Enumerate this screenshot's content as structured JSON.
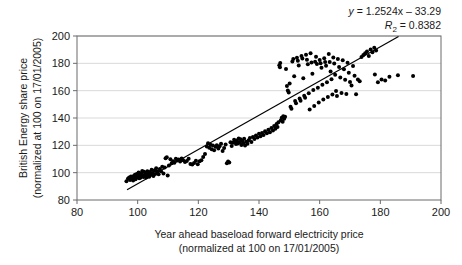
{
  "chart_data": {
    "type": "scatter",
    "title": "",
    "xlabel": "Year ahead baseload forward electricity price",
    "xlabel_line2": "(normalized at 100 on 17/01/2005)",
    "ylabel": "British Energy share price",
    "ylabel_line2": "(normalized at 100 on 17/01/2005)",
    "xlim": [
      80,
      200
    ],
    "ylim": [
      80,
      200
    ],
    "xticks": [
      80,
      100,
      120,
      140,
      160,
      180,
      200
    ],
    "yticks": [
      80,
      100,
      120,
      140,
      160,
      180,
      200
    ],
    "grid": "horizontal",
    "legend": "none",
    "annotations": {
      "equation": "y = 1.2524x – 33.29",
      "r_squared": "R² = 0.8382",
      "equation_y_symbol": "y",
      "equation_body": " = 1.2524x – 33.29",
      "r2_symbol": "R",
      "r2_sub": "2",
      "r2_body": " = 0.8382"
    },
    "trendline": {
      "slope": 1.2524,
      "intercept": -33.29,
      "x_start": 96.5,
      "x_end": 186.0,
      "color": "#000000"
    },
    "marker": {
      "shape": "circle",
      "color": "#000000",
      "size": 2.0
    },
    "point_count": 221,
    "points": [
      [
        96.3,
        93.8
      ],
      [
        96.8,
        95.5
      ],
      [
        97.2,
        96.4
      ],
      [
        97.5,
        94.7
      ],
      [
        97.8,
        97.2
      ],
      [
        98.0,
        95.8
      ],
      [
        98.3,
        96.9
      ],
      [
        98.5,
        94.3
      ],
      [
        98.7,
        97.6
      ],
      [
        98.9,
        96.1
      ],
      [
        99.1,
        98.4
      ],
      [
        99.3,
        95.2
      ],
      [
        99.5,
        97.0
      ],
      [
        99.7,
        99.1
      ],
      [
        99.9,
        96.6
      ],
      [
        100.1,
        97.8
      ],
      [
        100.3,
        100.2
      ],
      [
        100.5,
        95.9
      ],
      [
        100.7,
        98.7
      ],
      [
        100.9,
        96.3
      ],
      [
        101.1,
        99.5
      ],
      [
        101.3,
        97.4
      ],
      [
        101.5,
        101.3
      ],
      [
        101.7,
        98.1
      ],
      [
        101.9,
        96.8
      ],
      [
        102.1,
        100.6
      ],
      [
        102.3,
        97.9
      ],
      [
        102.5,
        99.8
      ],
      [
        102.8,
        96.5
      ],
      [
        103.0,
        98.3
      ],
      [
        103.2,
        101.0
      ],
      [
        103.5,
        99.2
      ],
      [
        103.8,
        97.1
      ],
      [
        104.0,
        100.4
      ],
      [
        104.3,
        98.6
      ],
      [
        104.6,
        102.1
      ],
      [
        104.9,
        99.7
      ],
      [
        105.2,
        97.5
      ],
      [
        105.5,
        101.5
      ],
      [
        105.8,
        99.0
      ],
      [
        106.1,
        103.2
      ],
      [
        106.5,
        100.8
      ],
      [
        106.9,
        98.9
      ],
      [
        107.3,
        102.6
      ],
      [
        107.7,
        101.1
      ],
      [
        108.1,
        104.3
      ],
      [
        108.5,
        99.4
      ],
      [
        108.9,
        103.8
      ],
      [
        109.2,
        110.6
      ],
      [
        109.6,
        111.2
      ],
      [
        109.9,
        97.9
      ],
      [
        110.3,
        105.2
      ],
      [
        110.8,
        109.8
      ],
      [
        111.2,
        106.9
      ],
      [
        111.7,
        108.4
      ],
      [
        112.1,
        107.3
      ],
      [
        112.6,
        110.1
      ],
      [
        113.0,
        108.9
      ],
      [
        113.5,
        109.6
      ],
      [
        114.0,
        108.2
      ],
      [
        114.5,
        110.4
      ],
      [
        115.0,
        109.1
      ],
      [
        115.6,
        107.8
      ],
      [
        116.2,
        108.6
      ],
      [
        116.8,
        110.2
      ],
      [
        117.4,
        106.4
      ],
      [
        118.0,
        105.9
      ],
      [
        118.6,
        107.1
      ],
      [
        119.2,
        108.8
      ],
      [
        119.8,
        106.2
      ],
      [
        120.4,
        108.3
      ],
      [
        121.0,
        109.0
      ],
      [
        121.6,
        111.4
      ],
      [
        122.2,
        113.7
      ],
      [
        122.8,
        119.2
      ],
      [
        123.2,
        121.6
      ],
      [
        123.6,
        118.3
      ],
      [
        124.0,
        120.5
      ],
      [
        124.4,
        117.1
      ],
      [
        124.8,
        119.8
      ],
      [
        125.2,
        116.4
      ],
      [
        125.7,
        118.9
      ],
      [
        126.1,
        120.1
      ],
      [
        126.6,
        117.6
      ],
      [
        127.0,
        119.4
      ],
      [
        127.5,
        121.2
      ],
      [
        128.0,
        115.8
      ],
      [
        128.5,
        118.1
      ],
      [
        129.0,
        120.7
      ],
      [
        129.4,
        106.8
      ],
      [
        129.8,
        108.1
      ],
      [
        130.2,
        107.4
      ],
      [
        130.6,
        122.3
      ],
      [
        131.0,
        119.6
      ],
      [
        131.4,
        121.8
      ],
      [
        131.8,
        124.1
      ],
      [
        132.1,
        122.7
      ],
      [
        132.4,
        120.9
      ],
      [
        132.7,
        123.5
      ],
      [
        133.0,
        121.4
      ],
      [
        133.3,
        125.0
      ],
      [
        133.6,
        122.0
      ],
      [
        133.9,
        124.4
      ],
      [
        134.2,
        120.3
      ],
      [
        134.5,
        123.1
      ],
      [
        134.8,
        121.7
      ],
      [
        135.1,
        124.8
      ],
      [
        135.4,
        119.9
      ],
      [
        135.8,
        122.6
      ],
      [
        136.2,
        121.1
      ],
      [
        136.6,
        123.8
      ],
      [
        137.0,
        125.3
      ],
      [
        137.5,
        122.4
      ],
      [
        138.0,
        126.1
      ],
      [
        138.5,
        124.6
      ],
      [
        139.0,
        127.2
      ],
      [
        139.5,
        125.8
      ],
      [
        140.0,
        128.4
      ],
      [
        140.5,
        126.7
      ],
      [
        141.0,
        129.1
      ],
      [
        141.5,
        127.5
      ],
      [
        142.0,
        130.3
      ],
      [
        142.6,
        128.8
      ],
      [
        143.1,
        131.4
      ],
      [
        143.6,
        129.6
      ],
      [
        144.1,
        132.7
      ],
      [
        144.6,
        130.8
      ],
      [
        145.0,
        134.1
      ],
      [
        145.4,
        132.2
      ],
      [
        145.8,
        135.6
      ],
      [
        146.1,
        133.4
      ],
      [
        146.4,
        136.9
      ],
      [
        146.7,
        178.6
      ],
      [
        147.0,
        180.2
      ],
      [
        147.2,
        138.3
      ],
      [
        147.5,
        140.1
      ],
      [
        147.8,
        137.2
      ],
      [
        148.0,
        141.3
      ],
      [
        148.3,
        139.4
      ],
      [
        148.6,
        141.0
      ],
      [
        148.9,
        175.8
      ],
      [
        149.2,
        163.4
      ],
      [
        149.5,
        160.1
      ],
      [
        149.8,
        158.6
      ],
      [
        150.1,
        165.2
      ],
      [
        150.4,
        148.3
      ],
      [
        150.7,
        146.7
      ],
      [
        151.0,
        181.4
      ],
      [
        151.3,
        183.2
      ],
      [
        151.6,
        170.6
      ],
      [
        151.9,
        152.4
      ],
      [
        152.2,
        150.8
      ],
      [
        152.5,
        184.1
      ],
      [
        152.8,
        181.9
      ],
      [
        153.1,
        178.4
      ],
      [
        153.4,
        154.2
      ],
      [
        153.7,
        152.6
      ],
      [
        154.0,
        185.3
      ],
      [
        154.3,
        183.6
      ],
      [
        154.6,
        169.1
      ],
      [
        154.9,
        156.3
      ],
      [
        155.2,
        154.8
      ],
      [
        155.5,
        186.2
      ],
      [
        155.8,
        182.7
      ],
      [
        156.1,
        179.3
      ],
      [
        156.4,
        158.1
      ],
      [
        156.7,
        146.2
      ],
      [
        157.0,
        187.4
      ],
      [
        157.3,
        180.6
      ],
      [
        157.6,
        172.3
      ],
      [
        157.9,
        160.4
      ],
      [
        158.2,
        148.7
      ],
      [
        158.5,
        181.2
      ],
      [
        158.8,
        184.8
      ],
      [
        159.1,
        179.6
      ],
      [
        159.4,
        162.1
      ],
      [
        159.7,
        151.3
      ],
      [
        160.0,
        182.4
      ],
      [
        160.3,
        180.1
      ],
      [
        160.6,
        176.8
      ],
      [
        160.9,
        164.3
      ],
      [
        161.2,
        153.6
      ],
      [
        161.5,
        183.7
      ],
      [
        161.8,
        181.0
      ],
      [
        162.1,
        178.2
      ],
      [
        162.4,
        166.1
      ],
      [
        162.7,
        155.4
      ],
      [
        163.0,
        186.8
      ],
      [
        163.3,
        180.9
      ],
      [
        163.6,
        174.1
      ],
      [
        163.9,
        168.4
      ],
      [
        164.2,
        157.2
      ],
      [
        164.5,
        184.3
      ],
      [
        164.8,
        179.8
      ],
      [
        165.1,
        171.6
      ],
      [
        165.4,
        159.8
      ],
      [
        165.7,
        156.1
      ],
      [
        166.0,
        183.1
      ],
      [
        166.4,
        177.4
      ],
      [
        166.8,
        169.7
      ],
      [
        167.2,
        158.3
      ],
      [
        167.6,
        182.2
      ],
      [
        168.0,
        175.6
      ],
      [
        168.4,
        167.9
      ],
      [
        168.8,
        157.6
      ],
      [
        169.2,
        180.4
      ],
      [
        169.6,
        173.2
      ],
      [
        170.0,
        166.4
      ],
      [
        170.5,
        163.8
      ],
      [
        171.0,
        178.1
      ],
      [
        171.5,
        171.0
      ],
      [
        172.0,
        157.4
      ],
      [
        172.6,
        168.2
      ],
      [
        173.2,
        166.8
      ],
      [
        173.8,
        184.6
      ],
      [
        174.4,
        186.1
      ],
      [
        175.0,
        187.3
      ],
      [
        175.6,
        188.6
      ],
      [
        176.2,
        185.4
      ],
      [
        176.8,
        190.2
      ],
      [
        177.4,
        188.1
      ],
      [
        178.0,
        191.4
      ],
      [
        178.6,
        189.3
      ],
      [
        179.2,
        166.2
      ],
      [
        180.4,
        168.1
      ],
      [
        181.6,
        167.4
      ],
      [
        183.0,
        170.1
      ],
      [
        185.8,
        171.3
      ],
      [
        190.8,
        170.8
      ],
      [
        178.2,
        171.9
      ],
      [
        146.9,
        177.1
      ]
    ]
  }
}
